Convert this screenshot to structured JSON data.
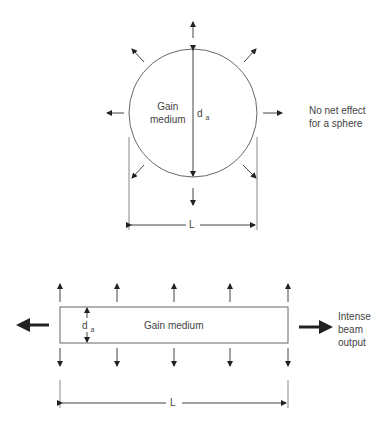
{
  "top_figure": {
    "medium_label_line1": "Gain",
    "medium_label_line2": "medium",
    "diameter_label": "d",
    "diameter_subscript": "a",
    "length_label": "L",
    "note_line1": "No net effect",
    "note_line2": "for a sphere"
  },
  "bottom_figure": {
    "medium_label": "Gain medium",
    "thickness_label": "d",
    "thickness_subscript": "a",
    "length_label": "L",
    "output_line1": "Intense",
    "output_line2": "beam",
    "output_line3": "output"
  }
}
